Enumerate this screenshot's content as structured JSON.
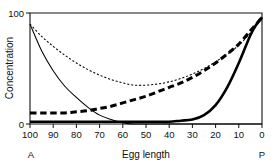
{
  "chart_data": {
    "type": "line",
    "title": "",
    "xlabel": "Egg length",
    "ylabel": "Concentration",
    "xlim": [
      100,
      0
    ],
    "ylim": [
      0,
      100
    ],
    "x_axis_reversed": true,
    "grid": false,
    "legend_position": "none",
    "x_ticks": [
      100,
      90,
      80,
      70,
      60,
      50,
      40,
      30,
      20,
      10,
      0
    ],
    "x_tick_labels": [
      "100",
      "90",
      "80",
      "70",
      "60",
      "50",
      "40",
      "30",
      "20",
      "10",
      "0"
    ],
    "y_ticks": [
      0,
      100
    ],
    "y_tick_labels": [
      "0",
      "100"
    ],
    "axis_end_labels": {
      "left": "A",
      "right": "P"
    },
    "x": [
      100,
      95,
      90,
      85,
      80,
      75,
      70,
      65,
      60,
      55,
      50,
      45,
      40,
      35,
      30,
      25,
      20,
      15,
      10,
      5,
      2,
      0
    ],
    "series": [
      {
        "name": "thin-solid",
        "style": "solid",
        "width": "thin",
        "color": "#000000",
        "values": [
          90,
          66,
          48,
          34,
          24,
          15,
          8,
          4,
          1,
          0,
          0,
          0,
          0,
          0,
          0,
          0,
          0,
          0,
          0,
          0,
          0,
          0
        ]
      },
      {
        "name": "thin-dotted",
        "style": "dotted",
        "width": "thin",
        "color": "#000000",
        "values": [
          90,
          79,
          70,
          62,
          55,
          49,
          44,
          40,
          37,
          35,
          35,
          36,
          38,
          41,
          45,
          50,
          56,
          63,
          71,
          82,
          90,
          96
        ]
      },
      {
        "name": "thick-dashed",
        "style": "dashed",
        "width": "thick",
        "color": "#000000",
        "values": [
          10,
          10,
          10,
          10,
          11,
          12,
          14,
          16,
          19,
          22,
          25,
          29,
          33,
          37,
          42,
          48,
          55,
          63,
          72,
          84,
          91,
          96
        ]
      },
      {
        "name": "thick-solid",
        "style": "solid",
        "width": "thick",
        "color": "#000000",
        "values": [
          2,
          2,
          2,
          2,
          2,
          2,
          2,
          2,
          2,
          2,
          2,
          2,
          2,
          3,
          4,
          8,
          17,
          33,
          55,
          80,
          91,
          96
        ]
      }
    ]
  },
  "geometry": {
    "plot_left": 30,
    "plot_right": 262,
    "plot_top": 13,
    "plot_bottom": 124
  }
}
